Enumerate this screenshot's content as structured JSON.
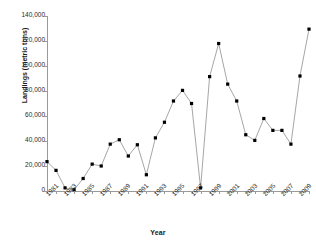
{
  "chart_data": {
    "type": "line",
    "title": "",
    "xlabel": "Year",
    "ylabel": "Landings (metric tons)",
    "xlim": [
      1981,
      2010
    ],
    "ylim": [
      0,
      140000
    ],
    "grid": false,
    "legend": null,
    "marker": "square",
    "marker_color": "#000000",
    "line_color": "#808080",
    "y_ticks": [
      0,
      20000,
      40000,
      60000,
      80000,
      100000,
      120000,
      140000
    ],
    "y_tick_labels": [
      "0",
      "20,000",
      "40,000",
      "60,000",
      "80,000",
      "100,000",
      "120,000",
      "140,000"
    ],
    "x_tick_labels": [
      "1981",
      "1983",
      "1985",
      "1987",
      "1989",
      "1991",
      "1993",
      "1995",
      "1997",
      "1999",
      "2001",
      "2003",
      "2005",
      "2007",
      "2009"
    ],
    "x": [
      1981,
      1982,
      1983,
      1984,
      1985,
      1986,
      1987,
      1988,
      1989,
      1990,
      1991,
      1992,
      1993,
      1994,
      1995,
      1996,
      1997,
      1998,
      1999,
      2000,
      2001,
      2002,
      2003,
      2004,
      2005,
      2006,
      2007,
      2008,
      2009,
      2010
    ],
    "values": [
      23500,
      16500,
      2500,
      1000,
      10000,
      21500,
      20000,
      37500,
      41000,
      28000,
      37000,
      13000,
      42500,
      55000,
      72000,
      80500,
      70000,
      2500,
      91500,
      118000,
      85500,
      72000,
      45000,
      40500,
      58000,
      48500,
      48500,
      37500,
      92000,
      129500
    ],
    "series_name": "Landings"
  },
  "axes": {
    "x_title": "Year",
    "y_title": "Landings (metric tons)"
  }
}
